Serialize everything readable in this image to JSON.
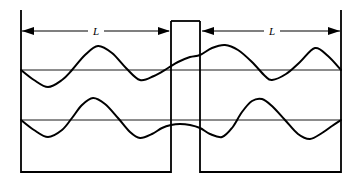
{
  "figure": {
    "title": "",
    "background_color": "#ffffff",
    "stroke_color": "#000000",
    "width": 363,
    "height": 182
  },
  "dimensions": {
    "left_label": "L",
    "right_label": "L"
  },
  "labels": {
    "left_dimension_name": "left-length-label",
    "right_dimension_name": "right-length-label"
  },
  "chart_data": {
    "type": "line",
    "title": "",
    "xlabel": "",
    "ylabel": "",
    "grid": false,
    "legend": null,
    "axis_lines": [
      {
        "name": "upper-baseline",
        "y": 70,
        "x_start": 21,
        "x_end": 341
      },
      {
        "name": "lower-baseline",
        "y": 120,
        "x_start": 21,
        "x_end": 341
      }
    ],
    "container": {
      "left_wall_x": 21,
      "right_wall_x": 341,
      "top_y": 10,
      "bottom_y": 172,
      "partition_left_x": 171,
      "partition_right_x": 200,
      "partition_top_y": 21
    },
    "series": [
      {
        "name": "upper-wave",
        "baseline_y": 70,
        "points_x": [
          21,
          34,
          48,
          62,
          72,
          85,
          98,
          112,
          126,
          140,
          154,
          168,
          178,
          190,
          200,
          212,
          225,
          238,
          252,
          265,
          272,
          286,
          300,
          315,
          328,
          341
        ],
        "points_y": [
          70,
          80,
          87,
          80,
          70,
          55,
          46,
          53,
          68,
          80,
          76,
          68,
          62,
          57,
          55,
          48,
          45,
          50,
          62,
          76,
          80,
          74,
          62,
          48,
          56,
          70
        ]
      },
      {
        "name": "lower-wave",
        "baseline_y": 120,
        "points_x": [
          21,
          34,
          48,
          62,
          72,
          82,
          93,
          105,
          118,
          130,
          140,
          152,
          162,
          171,
          180,
          190,
          200,
          210,
          222,
          232,
          242,
          252,
          262,
          272,
          285,
          298,
          310,
          322,
          332,
          341
        ],
        "points_y": [
          120,
          130,
          137,
          130,
          118,
          105,
          98,
          104,
          118,
          132,
          138,
          134,
          128,
          125,
          124,
          125,
          128,
          134,
          137,
          128,
          112,
          101,
          99,
          106,
          120,
          134,
          139,
          133,
          126,
          120
        ]
      }
    ],
    "annotations": [
      {
        "type": "dimension-arrow",
        "label": "L",
        "x_start": 21,
        "x_end": 171,
        "y": 31
      },
      {
        "type": "dimension-arrow",
        "label": "L",
        "x_start": 200,
        "x_end": 341,
        "y": 31
      }
    ]
  }
}
